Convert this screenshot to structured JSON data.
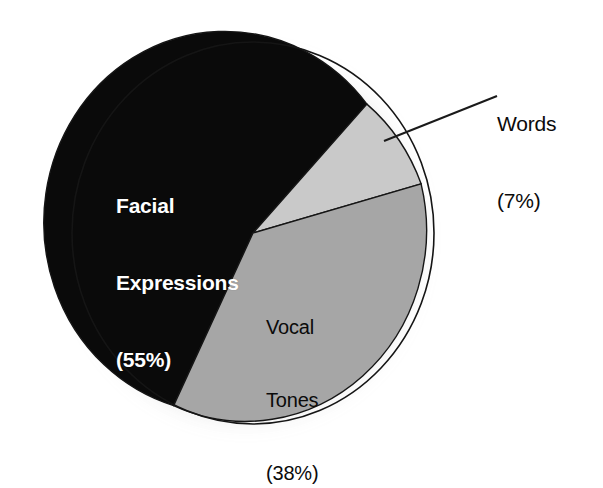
{
  "chart_data": {
    "type": "pie",
    "title": "",
    "subtitle": "",
    "xlabel": "",
    "ylabel": "",
    "legend_position": "none",
    "grid": false,
    "units": "percent",
    "total": 100,
    "categories": [
      "Facial Expressions",
      "Vocal Tones",
      "Words"
    ],
    "values": [
      55,
      38,
      7
    ],
    "slices": [
      {
        "name": "Facial Expressions",
        "value": 55,
        "value_text": "(55%)",
        "label_line1": "Facial",
        "label_line2": "Expressions",
        "label_line3": "(55%)",
        "color": "#0a0a0a",
        "text_color": "#ffffff",
        "label_placement": "inside",
        "start_angle_deg": 116,
        "sweep_deg": 198
      },
      {
        "name": "Words",
        "value": 7,
        "value_text": "(7%)",
        "label_line1": "Words",
        "label_line2": "(7%)",
        "color": "#c9c9c9",
        "text_color": "#0b0b0b",
        "label_placement": "outside-leader",
        "start_angle_deg": 314,
        "sweep_deg": 25
      },
      {
        "name": "Vocal Tones",
        "value": 38,
        "value_text": "(38%)",
        "label_line1": "Vocal",
        "label_line2": "Tones",
        "label_line3": "(38%)",
        "color": "#a6a6a6",
        "text_color": "#0b0b0b",
        "label_placement": "inside",
        "start_angle_deg": 339,
        "sweep_deg": 137
      }
    ],
    "colors": {
      "background": "#ffffff",
      "facial_expressions": "#0a0a0a",
      "vocal_tones": "#a6a6a6",
      "words": "#c9c9c9",
      "outline": "#1a1a1a",
      "leader_line": "#1a1a1a",
      "shadow": "#b9b9b9"
    },
    "annotations": [
      {
        "name": "words-leader-line",
        "from_x": 384,
        "from_y": 141,
        "to_x": 497,
        "to_y": 96
      }
    ]
  }
}
